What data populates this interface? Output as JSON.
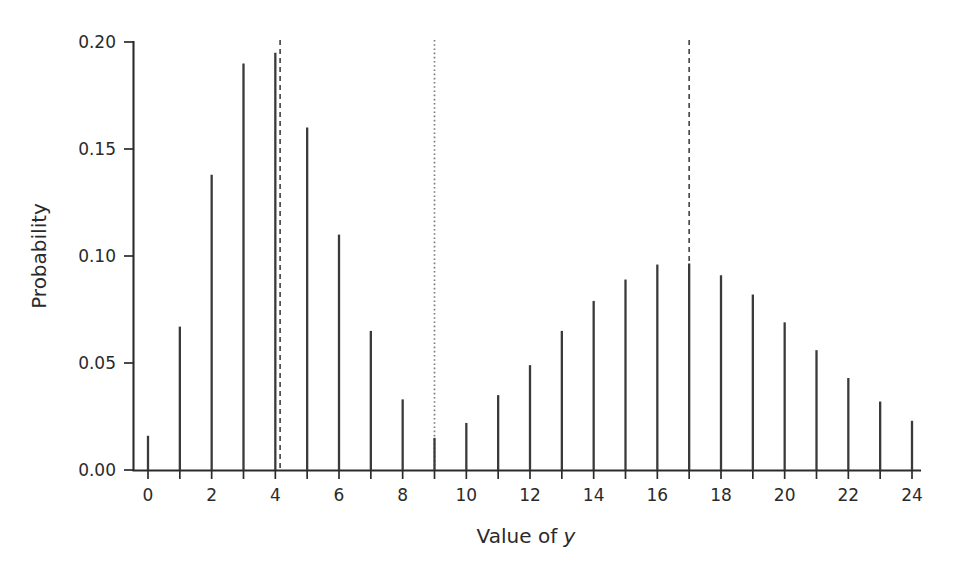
{
  "figure": {
    "background_color": "#ffffff",
    "ink_color": "#2b2b2b",
    "stem_color": "#3a3a3a"
  },
  "chart_data": {
    "type": "bar",
    "title": "",
    "subtitle": "",
    "xlabel_prefix": "Value of ",
    "xlabel_italic": "y",
    "xlabel": "Value of y",
    "ylabel": "Probability",
    "xlim": [
      -0.6,
      24.6
    ],
    "ylim": [
      0.0,
      0.205
    ],
    "grid": false,
    "legend": null,
    "style": "stem / needle plot",
    "categories": [
      0,
      1,
      2,
      3,
      4,
      5,
      6,
      7,
      8,
      9,
      10,
      11,
      12,
      13,
      14,
      15,
      16,
      17,
      18,
      19,
      20,
      21,
      22,
      23,
      24
    ],
    "values": [
      0.016,
      0.067,
      0.138,
      0.19,
      0.195,
      0.16,
      0.11,
      0.065,
      0.033,
      0.015,
      0.022,
      0.035,
      0.049,
      0.065,
      0.079,
      0.089,
      0.096,
      0.0965,
      0.091,
      0.082,
      0.069,
      0.056,
      0.043,
      0.032,
      0.023
    ],
    "x_ticks_major": [
      0,
      2,
      4,
      6,
      8,
      10,
      12,
      14,
      16,
      18,
      20,
      22,
      24
    ],
    "x_tick_labels": [
      "0",
      "2",
      "4",
      "6",
      "8",
      "10",
      "12",
      "14",
      "16",
      "18",
      "20",
      "22",
      "24"
    ],
    "x_ticks_minor": [
      1,
      3,
      5,
      7,
      9,
      11,
      13,
      15,
      17,
      19,
      21,
      23
    ],
    "y_ticks": [
      0.0,
      0.05,
      0.1,
      0.15,
      0.2
    ],
    "y_tick_labels": [
      "0.00",
      "0.05",
      "0.10",
      "0.15",
      "0.20"
    ],
    "annotations": [
      {
        "name": "mean-line-left",
        "type": "vline",
        "style": "dashed",
        "x": 4.15,
        "color": "#4a4a4a"
      },
      {
        "name": "midpoint-line",
        "type": "vline",
        "style": "dotted",
        "x": 9.0,
        "color": "#7d7d7d"
      },
      {
        "name": "mean-line-right",
        "type": "vline",
        "style": "dashed",
        "x": 17.0,
        "color": "#4a4a4a"
      }
    ]
  }
}
